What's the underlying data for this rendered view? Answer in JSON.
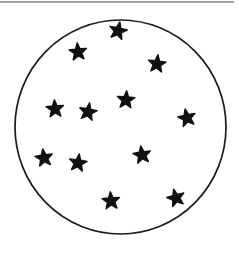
{
  "figure": {
    "background": "#ffffff",
    "top_rule": {
      "x": 0,
      "y": 1.2,
      "width": 234,
      "height": 1.5,
      "color": "#828282"
    },
    "circle": {
      "cx": 120.5,
      "cy": 127,
      "rx": 105.5,
      "ry": 107,
      "fill": "#ffffff",
      "stroke": "#1c1c1c",
      "stroke_width": 1.7
    },
    "stars": {
      "count": 12,
      "color": "#111111",
      "outer_radius": 9.2,
      "inner_radius_ratio": 0.42,
      "edge_stroke_width": 1.4,
      "positions": [
        {
          "x": 118,
          "y": 31,
          "rotation": 12
        },
        {
          "x": 78,
          "y": 52,
          "rotation": -5
        },
        {
          "x": 157,
          "y": 64,
          "rotation": 6
        },
        {
          "x": 126,
          "y": 100,
          "rotation": 4
        },
        {
          "x": 55,
          "y": 109,
          "rotation": -4
        },
        {
          "x": 88,
          "y": 112,
          "rotation": 10
        },
        {
          "x": 187,
          "y": 118,
          "rotation": -12
        },
        {
          "x": 44,
          "y": 158,
          "rotation": -8
        },
        {
          "x": 78,
          "y": 163,
          "rotation": 8
        },
        {
          "x": 142,
          "y": 155,
          "rotation": -8
        },
        {
          "x": 111,
          "y": 201,
          "rotation": -4
        },
        {
          "x": 176,
          "y": 198,
          "rotation": -15
        }
      ]
    }
  }
}
